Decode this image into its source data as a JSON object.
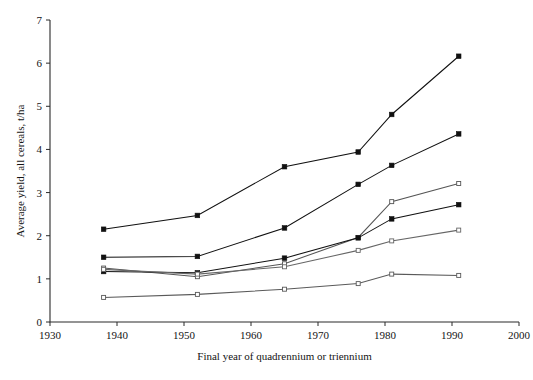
{
  "chart_data": {
    "type": "line",
    "title": "",
    "subtitle": "",
    "xlabel": "Final year of quadrennium or triennium",
    "ylabel": "Average yield, all cereals, t/ha",
    "xlim": [
      1930,
      2000
    ],
    "ylim": [
      0,
      7
    ],
    "xticks": [
      1930,
      1940,
      1950,
      1960,
      1970,
      1980,
      1990,
      2000
    ],
    "xtick_labels": [
      "1930",
      "1940",
      "1950",
      "1960",
      "1970",
      "1980",
      "1990",
      "2000"
    ],
    "yticks": [
      0,
      1,
      2,
      3,
      4,
      5,
      6,
      7
    ],
    "ytick_labels": [
      "0",
      "1",
      "2",
      "3",
      "4",
      "5",
      "6",
      "7"
    ],
    "grid": false,
    "legend": "none",
    "x": [
      1938,
      1952,
      1965,
      1976,
      1981,
      1991
    ],
    "series": [
      {
        "name": "series-1-top",
        "marker": "filled-square",
        "color": "#111111",
        "values": [
          2.15,
          2.47,
          3.6,
          3.94,
          4.81,
          6.16
        ]
      },
      {
        "name": "series-2",
        "marker": "filled-square",
        "color": "#111111",
        "values": [
          1.5,
          1.52,
          2.18,
          3.19,
          3.63,
          4.36
        ]
      },
      {
        "name": "series-3",
        "marker": "open-square",
        "color": "#555555",
        "values": [
          1.25,
          1.05,
          1.35,
          1.96,
          2.79,
          3.21
        ]
      },
      {
        "name": "series-4",
        "marker": "filled-square",
        "color": "#111111",
        "values": [
          1.17,
          1.14,
          1.48,
          1.95,
          2.39,
          2.72
        ]
      },
      {
        "name": "series-5",
        "marker": "open-square",
        "color": "#666666",
        "values": [
          1.22,
          1.11,
          1.28,
          1.66,
          1.88,
          2.13
        ]
      },
      {
        "name": "series-6-bottom",
        "marker": "open-square",
        "color": "#5a5a5a",
        "values": [
          0.57,
          0.64,
          0.76,
          0.89,
          1.11,
          1.08
        ]
      }
    ]
  },
  "axes": {
    "x_axis_title": "Final year of quadrennium or triennium",
    "y_axis_title": "Average yield, all cereals, t/ha"
  }
}
